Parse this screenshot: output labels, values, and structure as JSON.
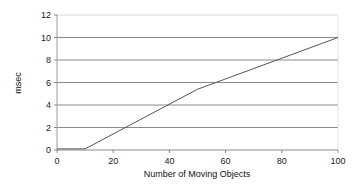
{
  "chart_data": {
    "type": "line",
    "title": "",
    "xlabel": "Number of Moving Objects",
    "ylabel": "msec",
    "xlim": [
      0,
      100
    ],
    "ylim": [
      0,
      12
    ],
    "x_ticks": [
      0,
      20,
      40,
      60,
      80,
      100
    ],
    "y_ticks": [
      0,
      2,
      4,
      6,
      8,
      10,
      12
    ],
    "grid": "horizontal",
    "legend": "none",
    "series": [
      {
        "name": "msec",
        "color": "#555555",
        "x": [
          0,
          10,
          50,
          100
        ],
        "values": [
          0.1,
          0.1,
          5.4,
          10.0
        ]
      }
    ]
  }
}
